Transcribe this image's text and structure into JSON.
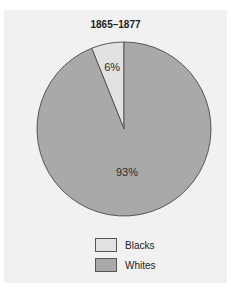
{
  "chart_data": {
    "type": "pie",
    "title": "1865–1877",
    "categories": [
      "Blacks",
      "Whites"
    ],
    "values": [
      6,
      93
    ],
    "labels": [
      "6%",
      "93%"
    ],
    "colors": [
      "#e2e2e2",
      "#a9a9a9"
    ],
    "legend_position": "bottom",
    "start_angle_deg": 0,
    "direction": "counterclockwise"
  },
  "colors": {
    "panel_background": "#f1f1f1",
    "outline": "#555555"
  }
}
